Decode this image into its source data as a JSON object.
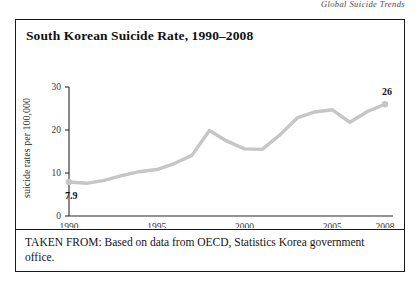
{
  "page": {
    "running_header": "Global Suicide Trends"
  },
  "figure": {
    "title": "South Korean Suicide Rate, 1990–2008",
    "source_note": "TAKEN FROM: Based on data from OECD, Statistics Korea government office."
  },
  "chart_data": {
    "type": "line",
    "title": "South Korean Suicide Rate, 1990–2008",
    "xlabel": "",
    "ylabel": "suicide rates per 100,000",
    "xlim": [
      1990,
      2008
    ],
    "ylim": [
      0,
      30
    ],
    "grid": false,
    "legend": false,
    "line_color": "#c6c6c6",
    "x_ticks": [
      "1990",
      "1995",
      "2000",
      "2005",
      "2008"
    ],
    "x_tick_values": [
      1990,
      1995,
      2000,
      2005,
      2008
    ],
    "y_ticks": [
      "0",
      "10",
      "20",
      "30"
    ],
    "y_tick_values": [
      0,
      10,
      20,
      30
    ],
    "x": [
      1990,
      1991,
      1992,
      1993,
      1994,
      1995,
      1996,
      1997,
      1998,
      1999,
      2000,
      2001,
      2002,
      2003,
      2004,
      2005,
      2006,
      2007,
      2008
    ],
    "values": [
      7.9,
      7.6,
      8.3,
      9.4,
      10.3,
      10.8,
      12.2,
      14.1,
      19.9,
      17.4,
      15.6,
      15.5,
      18.8,
      22.8,
      24.2,
      24.7,
      21.8,
      24.3,
      26.0
    ],
    "annotations": [
      {
        "name": "first-point-label",
        "text": "7.9",
        "x": 1990,
        "y": 7.9
      },
      {
        "name": "last-point-label",
        "text": "26",
        "x": 2008,
        "y": 26.0
      }
    ],
    "markers": [
      {
        "x": 1990,
        "y": 7.9
      },
      {
        "x": 2008,
        "y": 26.0
      }
    ]
  }
}
